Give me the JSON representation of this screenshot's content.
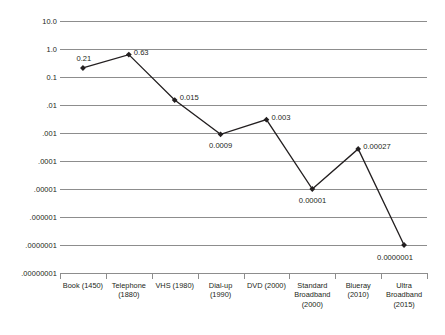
{
  "chart_data": {
    "type": "line",
    "title": "",
    "xlabel": "",
    "ylabel": "",
    "yscale": "log",
    "ylim": [
      1e-08,
      10.0
    ],
    "grid": true,
    "legend": "none",
    "categories": [
      "Book (1450)",
      "Telephone (1880)",
      "VHS (1980)",
      "Dial-up (1990)",
      "DVD (2000)",
      "Standard Broadband (2000)",
      "Blueray (2010)",
      "Ultra Broadband (2015)"
    ],
    "category_lines": [
      [
        "Book (1450)"
      ],
      [
        "Telephone",
        "(1880)"
      ],
      [
        "VHS (1980)"
      ],
      [
        "Dial-up",
        "(1990)"
      ],
      [
        "DVD (2000)"
      ],
      [
        "Standard",
        "Broadband",
        "(2000)"
      ],
      [
        "Blueray",
        "(2010)"
      ],
      [
        "Ultra",
        "Broadband",
        "(2015)"
      ]
    ],
    "values": [
      0.21,
      0.63,
      0.015,
      0.0009,
      0.003,
      1e-05,
      0.00027,
      1e-07
    ],
    "point_labels": [
      "0.21",
      "0.63",
      "0.015",
      "0.0009",
      "0.003",
      "0.00001",
      "0.00027",
      "0.0000001"
    ],
    "label_positions": [
      "above-left",
      "right",
      "right",
      "below",
      "right",
      "below",
      "right",
      "below-left"
    ],
    "ytick_labels": [
      "10.0",
      "1.0",
      "0.1",
      ".01",
      ".001",
      ".0001",
      ".00001",
      ".000001",
      ".0000001",
      ".00000001"
    ],
    "ytick_values": [
      10,
      1,
      0.1,
      0.01,
      0.001,
      0.0001,
      1e-05,
      1e-06,
      1e-07,
      1e-08
    ],
    "colors": {
      "line": "#231f20",
      "marker": "#231f20",
      "gridline": "#8d8d8d",
      "text": "#231f20",
      "background": "#ffffff"
    }
  }
}
